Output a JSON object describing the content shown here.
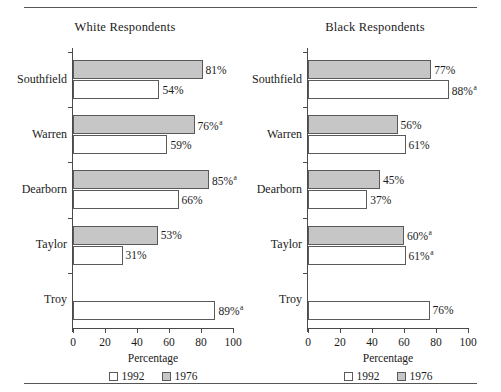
{
  "figure": {
    "top_rule": true,
    "bottom_rule": true,
    "axis_title": "Percentage",
    "legend": [
      {
        "key": "y1992",
        "label": "1992",
        "color": "#ffffff"
      },
      {
        "key": "y1976",
        "label": "1976",
        "color": "#c6c6c6"
      }
    ],
    "x_ticks": [
      0,
      20,
      40,
      60,
      80,
      100
    ],
    "footnote_marker": "a"
  },
  "panels": [
    {
      "id": "white",
      "title": "White Respondents"
    },
    {
      "id": "black",
      "title": "Black Respondents"
    }
  ],
  "chart_data": [
    {
      "type": "bar",
      "orientation": "horizontal",
      "title": "White Respondents",
      "xlabel": "Percentage",
      "ylabel": "",
      "xlim": [
        0,
        100
      ],
      "xticks": [
        0,
        20,
        40,
        60,
        80,
        100
      ],
      "grid": false,
      "legend_position": "bottom",
      "categories": [
        "Southfield",
        "Warren",
        "Dearborn",
        "Taylor",
        "Troy"
      ],
      "series": [
        {
          "name": "1976",
          "color": "#c6c6c6",
          "values": [
            81,
            76,
            85,
            53,
            null
          ],
          "labels": [
            "81%",
            "76%",
            "85%",
            "53%",
            ""
          ],
          "markers": [
            "",
            "a",
            "a",
            "",
            ""
          ]
        },
        {
          "name": "1992",
          "color": "#ffffff",
          "values": [
            54,
            59,
            66,
            31,
            89
          ],
          "labels": [
            "54%",
            "59%",
            "66%",
            "31%",
            "89%"
          ],
          "markers": [
            "",
            "",
            "",
            "",
            "a"
          ]
        }
      ]
    },
    {
      "type": "bar",
      "orientation": "horizontal",
      "title": "Black Respondents",
      "xlabel": "Percentage",
      "ylabel": "",
      "xlim": [
        0,
        100
      ],
      "xticks": [
        0,
        20,
        40,
        60,
        80,
        100
      ],
      "grid": false,
      "legend_position": "bottom",
      "categories": [
        "Southfield",
        "Warren",
        "Dearborn",
        "Taylor",
        "Troy"
      ],
      "series": [
        {
          "name": "1976",
          "color": "#c6c6c6",
          "values": [
            77,
            56,
            45,
            60,
            null
          ],
          "labels": [
            "77%",
            "56%",
            "45%",
            "60%",
            ""
          ],
          "markers": [
            "",
            "",
            "",
            "a",
            ""
          ]
        },
        {
          "name": "1992",
          "color": "#ffffff",
          "values": [
            88,
            61,
            37,
            61,
            76
          ],
          "labels": [
            "88%",
            "61%",
            "37%",
            "61%",
            "76%"
          ],
          "markers": [
            "a",
            "",
            "",
            "a",
            ""
          ]
        }
      ]
    }
  ]
}
